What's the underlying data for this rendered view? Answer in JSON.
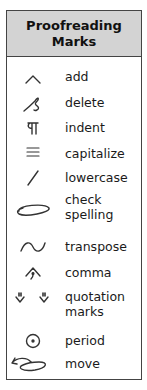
{
  "title": "Proofreading Marks",
  "title_lines": [
    "Proofreading",
    "Marks"
  ],
  "marks": [
    {
      "icon": "caret-icon",
      "label": "add"
    },
    {
      "icon": "delete-loop-icon",
      "label": "delete"
    },
    {
      "icon": "paragraph-icon",
      "label": "indent"
    },
    {
      "icon": "triple-underline-icon",
      "label": "capitalize"
    },
    {
      "icon": "slash-icon",
      "label": "lowercase"
    },
    {
      "icon": "circle-oval-icon",
      "label_lines": [
        "check",
        "spelling"
      ],
      "label": "check spelling"
    },
    {
      "icon": "tilde-icon",
      "label": "transpose"
    },
    {
      "icon": "caret-comma-icon",
      "label": "comma"
    },
    {
      "icon": "inverted-caret-quotes-icon",
      "label_lines": [
        "quotation",
        "marks"
      ],
      "label": "quotation marks"
    },
    {
      "icon": "circled-dot-icon",
      "label": "period"
    },
    {
      "icon": "move-arrow-icon",
      "label": "move"
    }
  ],
  "colors": {
    "header_bg": "#d3d3d3",
    "border": "#444444",
    "text": "#1a1a1a"
  }
}
